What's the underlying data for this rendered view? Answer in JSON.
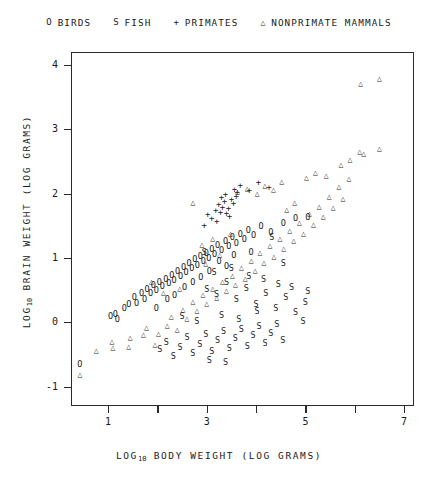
{
  "chart_data": {
    "type": "scatter",
    "title": "",
    "xlabel": "LOG10 BODY WEIGHT (LOG GRAMS)",
    "ylabel": "LOG10 BRAIN WEIGHT (LOG GRAMS)",
    "xlabel_parts": {
      "prefix": "LOG",
      "sub": "10",
      "rest": " BODY WEIGHT (LOG GRAMS)"
    },
    "ylabel_parts": {
      "prefix": "LOG",
      "sub": "10",
      "rest": " BRAIN WEIGHT (LOG GRAMS)"
    },
    "xlim": [
      0.25,
      7.2
    ],
    "ylim": [
      -1.3,
      4.2
    ],
    "xticks": [
      1,
      2,
      3,
      4,
      5,
      6,
      7
    ],
    "xticklabels": [
      "1",
      "",
      "3",
      "",
      "5",
      "",
      "7"
    ],
    "yticks": [
      -1,
      0,
      1,
      2,
      3,
      4
    ],
    "yticklabels": [
      "-1",
      "0",
      "1",
      "2",
      "3",
      "4"
    ],
    "grid": false,
    "legend_position": "above-plot",
    "series": [
      {
        "name": "BIRDS",
        "marker": "o",
        "legend_label": "BIRDS",
        "points": [
          [
            0.43,
            -0.64
          ],
          [
            1.05,
            0.1
          ],
          [
            1.15,
            0.13
          ],
          [
            1.19,
            0.06
          ],
          [
            1.33,
            0.23
          ],
          [
            1.42,
            0.28
          ],
          [
            1.53,
            0.4
          ],
          [
            1.58,
            0.3
          ],
          [
            1.68,
            0.46
          ],
          [
            1.74,
            0.36
          ],
          [
            1.79,
            0.52
          ],
          [
            1.86,
            0.45
          ],
          [
            1.92,
            0.58
          ],
          [
            1.98,
            0.5
          ],
          [
            2.04,
            0.63
          ],
          [
            2.1,
            0.56
          ],
          [
            2.17,
            0.68
          ],
          [
            2.23,
            0.61
          ],
          [
            2.29,
            0.74
          ],
          [
            2.34,
            0.66
          ],
          [
            2.41,
            0.8
          ],
          [
            2.47,
            0.72
          ],
          [
            2.53,
            0.86
          ],
          [
            2.58,
            0.78
          ],
          [
            2.64,
            0.92
          ],
          [
            2.7,
            0.84
          ],
          [
            2.76,
            0.98
          ],
          [
            2.81,
            0.89
          ],
          [
            2.87,
            1.03
          ],
          [
            2.93,
            0.95
          ],
          [
            2.99,
            1.08
          ],
          [
            3.04,
            1.0
          ],
          [
            3.1,
            1.14
          ],
          [
            3.16,
            1.06
          ],
          [
            3.22,
            1.2
          ],
          [
            3.3,
            1.12
          ],
          [
            3.38,
            1.26
          ],
          [
            3.45,
            1.18
          ],
          [
            3.52,
            1.32
          ],
          [
            3.6,
            1.24
          ],
          [
            3.68,
            1.38
          ],
          [
            3.76,
            1.29
          ],
          [
            3.84,
            1.43
          ],
          [
            3.95,
            1.35
          ],
          [
            4.1,
            1.49
          ],
          [
            4.3,
            1.41
          ],
          [
            4.55,
            1.55
          ],
          [
            4.8,
            1.62
          ],
          [
            5.05,
            1.64
          ],
          [
            2.2,
            0.36
          ],
          [
            2.55,
            0.55
          ],
          [
            2.88,
            0.7
          ],
          [
            3.25,
            0.95
          ],
          [
            3.55,
            1.05
          ],
          [
            1.98,
            0.22
          ],
          [
            2.35,
            0.42
          ],
          [
            2.72,
            0.62
          ],
          [
            3.05,
            0.8
          ],
          [
            3.4,
            0.88
          ],
          [
            3.9,
            1.1
          ]
        ]
      },
      {
        "name": "FISH",
        "marker": "S",
        "legend_label": "FISH",
        "points": [
          [
            2.05,
            -0.42
          ],
          [
            2.18,
            -0.3
          ],
          [
            2.32,
            -0.52
          ],
          [
            2.46,
            -0.38
          ],
          [
            2.6,
            -0.22
          ],
          [
            2.72,
            -0.48
          ],
          [
            2.86,
            -0.34
          ],
          [
            2.98,
            -0.18
          ],
          [
            3.1,
            -0.44
          ],
          [
            3.22,
            -0.28
          ],
          [
            3.34,
            -0.14
          ],
          [
            3.46,
            -0.4
          ],
          [
            3.58,
            -0.24
          ],
          [
            3.7,
            -0.1
          ],
          [
            3.82,
            -0.36
          ],
          [
            3.94,
            -0.2
          ],
          [
            4.06,
            -0.06
          ],
          [
            4.18,
            -0.32
          ],
          [
            4.3,
            -0.16
          ],
          [
            4.42,
            -0.02
          ],
          [
            4.54,
            -0.28
          ],
          [
            3.0,
            0.52
          ],
          [
            3.2,
            0.44
          ],
          [
            3.4,
            0.62
          ],
          [
            3.6,
            0.36
          ],
          [
            3.8,
            0.54
          ],
          [
            4.0,
            0.28
          ],
          [
            4.2,
            0.46
          ],
          [
            4.4,
            0.22
          ],
          [
            4.6,
            0.4
          ],
          [
            4.8,
            0.16
          ],
          [
            5.0,
            0.32
          ],
          [
            3.15,
            0.78
          ],
          [
            3.5,
            0.85
          ],
          [
            3.85,
            0.72
          ],
          [
            4.15,
            0.68
          ],
          [
            4.45,
            0.6
          ],
          [
            4.72,
            0.55
          ],
          [
            5.05,
            0.48
          ],
          [
            4.95,
            0.02
          ],
          [
            3.3,
            0.12
          ],
          [
            3.65,
            0.05
          ],
          [
            4.02,
            0.18
          ],
          [
            2.5,
            0.1
          ],
          [
            2.8,
            0.02
          ],
          [
            3.05,
            -0.58
          ],
          [
            3.38,
            -0.62
          ],
          [
            2.95,
            1.1
          ],
          [
            4.32,
            1.32
          ],
          [
            4.55,
            0.92
          ]
        ]
      },
      {
        "name": "PRIMATES",
        "marker": "+",
        "legend_label": "PRIMATES",
        "points": [
          [
            3.02,
            1.68
          ],
          [
            3.18,
            1.75
          ],
          [
            3.28,
            1.72
          ],
          [
            3.32,
            1.8
          ],
          [
            3.36,
            1.88
          ],
          [
            3.3,
            1.95
          ],
          [
            3.24,
            1.84
          ],
          [
            3.4,
            1.7
          ],
          [
            3.44,
            1.78
          ],
          [
            3.5,
            1.92
          ],
          [
            3.56,
            2.08
          ],
          [
            3.62,
            2.02
          ],
          [
            3.1,
            1.62
          ],
          [
            3.46,
            1.66
          ],
          [
            3.68,
            2.14
          ],
          [
            3.86,
            2.06
          ],
          [
            4.05,
            2.18
          ],
          [
            4.26,
            2.1
          ],
          [
            3.54,
            1.85
          ],
          [
            3.38,
            2.0
          ],
          [
            3.2,
            1.58
          ],
          [
            3.6,
            1.96
          ],
          [
            2.95,
            1.52
          ]
        ]
      },
      {
        "name": "NONPRIMATE MAMMALS",
        "marker": "triangle",
        "legend_label": "NONPRIMATE MAMMALS",
        "points": [
          [
            0.43,
            -0.82
          ],
          [
            0.76,
            -0.45
          ],
          [
            1.08,
            -0.3
          ],
          [
            1.1,
            -0.4
          ],
          [
            1.42,
            -0.38
          ],
          [
            1.45,
            -0.25
          ],
          [
            1.72,
            -0.2
          ],
          [
            1.78,
            -0.08
          ],
          [
            1.95,
            -0.35
          ],
          [
            2.02,
            -0.18
          ],
          [
            2.2,
            -0.05
          ],
          [
            2.28,
            0.08
          ],
          [
            2.4,
            -0.12
          ],
          [
            2.52,
            0.2
          ],
          [
            2.6,
            0.05
          ],
          [
            2.72,
            0.32
          ],
          [
            2.8,
            0.18
          ],
          [
            2.92,
            0.42
          ],
          [
            3.0,
            0.28
          ],
          [
            3.12,
            0.52
          ],
          [
            3.2,
            0.38
          ],
          [
            3.32,
            0.62
          ],
          [
            3.4,
            0.48
          ],
          [
            3.52,
            0.72
          ],
          [
            3.58,
            0.58
          ],
          [
            3.7,
            0.85
          ],
          [
            3.78,
            0.68
          ],
          [
            3.9,
            0.95
          ],
          [
            3.98,
            0.8
          ],
          [
            4.08,
            1.08
          ],
          [
            4.16,
            0.92
          ],
          [
            4.28,
            1.18
          ],
          [
            4.36,
            1.02
          ],
          [
            4.48,
            1.3
          ],
          [
            4.56,
            1.14
          ],
          [
            4.68,
            1.42
          ],
          [
            4.76,
            1.26
          ],
          [
            4.88,
            1.55
          ],
          [
            4.96,
            1.38
          ],
          [
            5.08,
            1.68
          ],
          [
            5.16,
            1.52
          ],
          [
            5.28,
            1.8
          ],
          [
            5.36,
            1.64
          ],
          [
            5.48,
            1.95
          ],
          [
            5.56,
            1.78
          ],
          [
            5.68,
            2.1
          ],
          [
            5.76,
            1.92
          ],
          [
            5.88,
            2.22
          ],
          [
            6.1,
            2.65
          ],
          [
            6.18,
            2.62
          ],
          [
            6.5,
            2.7
          ],
          [
            6.12,
            3.7
          ],
          [
            6.5,
            3.78
          ],
          [
            2.72,
            1.85
          ],
          [
            3.62,
            2.02
          ],
          [
            3.82,
            2.08
          ],
          [
            4.02,
            2.0
          ],
          [
            4.18,
            2.12
          ],
          [
            4.35,
            2.05
          ],
          [
            4.52,
            2.18
          ],
          [
            3.48,
            1.38
          ],
          [
            3.12,
            1.3
          ],
          [
            2.9,
            1.2
          ],
          [
            5.72,
            2.45
          ],
          [
            5.9,
            2.52
          ],
          [
            4.62,
            1.75
          ],
          [
            4.78,
            1.85
          ],
          [
            2.45,
            0.52
          ],
          [
            2.12,
            0.45
          ],
          [
            1.88,
            0.62
          ],
          [
            5.02,
            2.25
          ],
          [
            5.2,
            2.32
          ],
          [
            5.42,
            2.28
          ],
          [
            3.26,
            1.05
          ],
          [
            2.98,
            0.9
          ]
        ]
      }
    ]
  },
  "legend": {
    "entries": [
      {
        "symbol": "O",
        "label": "BIRDS"
      },
      {
        "symbol": "S",
        "label": "FISH"
      },
      {
        "symbol": "+",
        "label": "PRIMATES"
      },
      {
        "symbol": "△",
        "label": "NONPRIMATE MAMMALS"
      }
    ]
  }
}
